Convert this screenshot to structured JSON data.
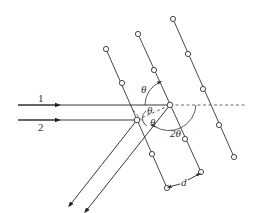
{
  "diagram": {
    "rays": [
      {
        "id": "1",
        "label": "1"
      },
      {
        "id": "2",
        "label": "2"
      }
    ],
    "angle_labels": {
      "theta_top": "θ",
      "theta_mid_upper": "θ",
      "theta_mid_lower": "θ",
      "two_theta": "2θ"
    },
    "spacing_label": "d",
    "colors": {
      "line": "#333333",
      "background": "#ffffff"
    },
    "lattice_planes": [
      {
        "name": "plane-left",
        "atoms": [
          [
            106,
            49
          ],
          [
            122,
            83
          ],
          [
            137,
            120
          ],
          [
            152,
            154
          ],
          [
            167,
            188
          ]
        ]
      },
      {
        "name": "plane-middle",
        "atoms": [
          [
            138,
            34
          ],
          [
            154,
            70
          ],
          [
            170,
            105
          ],
          [
            185,
            139
          ],
          [
            201,
            172
          ]
        ]
      },
      {
        "name": "plane-right",
        "atoms": [
          [
            173,
            19
          ],
          [
            188,
            54
          ],
          [
            203,
            89
          ],
          [
            219,
            125
          ],
          [
            234,
            157
          ]
        ]
      }
    ]
  }
}
